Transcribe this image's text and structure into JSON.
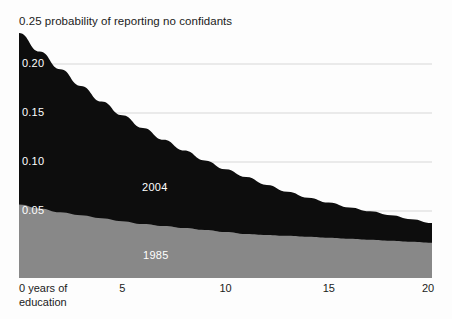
{
  "chart_data": {
    "type": "area",
    "title": "0.25 probability of reporting no confidants",
    "subtitle": "",
    "xlabel": "0 years of education",
    "ylabel": "probability of reporting no confidants",
    "stacked": false,
    "grid": true,
    "legend_position": "inline",
    "xlim": [
      0,
      20
    ],
    "ylim": [
      0,
      0.25
    ],
    "xticks": [
      {
        "value": 0,
        "label": "0 years of\neducation"
      },
      {
        "value": 5,
        "label": "5"
      },
      {
        "value": 10,
        "label": "10"
      },
      {
        "value": 15,
        "label": "15"
      },
      {
        "value": 20,
        "label": "20"
      }
    ],
    "yticks": [
      {
        "value": 0.25,
        "label": "0.25"
      },
      {
        "value": 0.2,
        "label": "0.20"
      },
      {
        "value": 0.15,
        "label": "0.15"
      },
      {
        "value": 0.1,
        "label": "0.10"
      },
      {
        "value": 0.05,
        "label": "0.05"
      }
    ],
    "x": [
      0,
      1,
      2,
      3,
      4,
      5,
      6,
      7,
      8,
      9,
      10,
      11,
      12,
      13,
      14,
      15,
      16,
      17,
      18,
      19,
      20
    ],
    "series": [
      {
        "name": "2004",
        "color": "#0d0d0d",
        "values": [
          0.25,
          0.231,
          0.213,
          0.196,
          0.18,
          0.166,
          0.153,
          0.141,
          0.13,
          0.12,
          0.111,
          0.103,
          0.095,
          0.088,
          0.082,
          0.077,
          0.072,
          0.068,
          0.064,
          0.06,
          0.056
        ]
      },
      {
        "name": "1985",
        "color": "#888888",
        "values": [
          0.075,
          0.071,
          0.067,
          0.064,
          0.061,
          0.058,
          0.055,
          0.053,
          0.051,
          0.049,
          0.047,
          0.045,
          0.044,
          0.043,
          0.042,
          0.041,
          0.04,
          0.039,
          0.038,
          0.037,
          0.036
        ]
      }
    ],
    "annotations": [
      {
        "text": "2004",
        "x": 6.2,
        "y": 0.118,
        "color": "#ffffff"
      },
      {
        "text": "1985",
        "x": 6.3,
        "y": 0.024,
        "color": "#ffffff"
      }
    ],
    "colors": {
      "series_2004": "#0d0d0d",
      "series_1985": "#888888",
      "gridline": "#d7d7d7",
      "background": "#fdfdfd",
      "text": "#1b1b1b",
      "inline_label": "#ffffff"
    }
  },
  "labels": {
    "title": "0.25 probability of reporting no confidants",
    "y_020": "0.20",
    "y_015": "0.15",
    "y_010": "0.10",
    "y_005": "0.05",
    "series_2004": "2004",
    "series_1985": "1985",
    "x_origin_line1": "0 years of",
    "x_origin_line2": "education",
    "x_5": "5",
    "x_10": "10",
    "x_15": "15",
    "x_20": "20"
  }
}
